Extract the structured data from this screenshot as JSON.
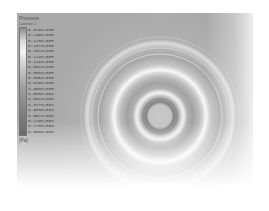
{
  "legend": {
    "title": "Pressure",
    "subtitle": "Contour 1",
    "unit": "[Pa]",
    "ticks": [
      "5.379e+005",
      "5.249e+005",
      "5.123e+005",
      "5.187e+005",
      "5.161e+005",
      "5.114e+005",
      "5.119e+005",
      "5.061e+005",
      "5.086e+005",
      "5.066e+005",
      "5.019e+005",
      "4.998e+005",
      "9.603e+004",
      "9.591e+004",
      "9.377e+004",
      "8.903e+004",
      "8.502e+004",
      "8.229e+004",
      "8.273e+004",
      "8.008e+004"
    ]
  },
  "plot": {
    "type": "contour",
    "colormap": "grayscale",
    "center": [
      143,
      103
    ],
    "background_color": "#a9a9a9"
  }
}
